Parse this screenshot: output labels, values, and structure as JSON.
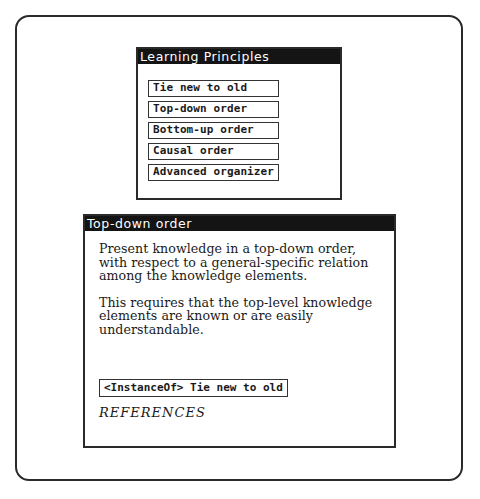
{
  "principles_panel": {
    "title": "Learning Principles",
    "items": [
      {
        "label": "Tie new to old"
      },
      {
        "label": "Top-down order"
      },
      {
        "label": "Bottom-up order"
      },
      {
        "label": "Causal order"
      },
      {
        "label": "Advanced organizer"
      }
    ]
  },
  "detail_panel": {
    "title": "Top-down order",
    "paragraphs": [
      "Present knowledge in a top-down order, with respect to a general-specific relation among the knowledge elements.",
      "This requires that the top-level knowledge elements are known or are easily understandable."
    ],
    "link_label": "<InstanceOf> Tie new to old",
    "references_label": "REFERENCES"
  }
}
